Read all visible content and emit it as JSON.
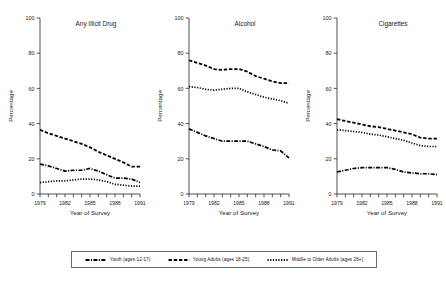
{
  "figure": {
    "ylabel": "Percentage",
    "xlabel": "Year of Survey",
    "ytick_labels": [
      "0",
      "20",
      "40",
      "60",
      "80",
      "100"
    ],
    "xtick_labels": [
      "1979",
      "1982",
      "1985",
      "1988",
      "1991"
    ],
    "line_color": "#000000",
    "axis_color": "#3d3d3d"
  },
  "legend": {
    "items": [
      {
        "label": "Youth (ages 12-17)",
        "dash": "dashdot"
      },
      {
        "label": "Young Adults (ages 18-25)",
        "dash": "dash"
      },
      {
        "label": "Middle to Older Adults (ages 26+)",
        "dash": "dot"
      }
    ]
  },
  "chart_data": [
    {
      "type": "line",
      "title": "Any Illicit Drug",
      "xlabel": "Year of Survey",
      "ylabel": "Percentage",
      "ylim": [
        0,
        100
      ],
      "yticks": [
        0,
        20,
        40,
        60,
        80,
        100
      ],
      "x": [
        1979,
        1980,
        1981,
        1982,
        1983,
        1984,
        1985,
        1986,
        1987,
        1988,
        1989,
        1990,
        1991
      ],
      "grid": false,
      "legend_position": "bottom",
      "series": [
        {
          "name": "Youth (ages 12-17)",
          "dash": "dashdot",
          "values": [
            17.0,
            16.0,
            14.5,
            13.0,
            13.5,
            13.5,
            14.5,
            13.0,
            11.0,
            9.0,
            9.0,
            8.5,
            6.5
          ]
        },
        {
          "name": "Young Adults (ages 18-25)",
          "dash": "dash",
          "values": [
            36.5,
            34.5,
            33.0,
            31.5,
            30.0,
            28.5,
            26.5,
            24.0,
            22.0,
            20.0,
            18.0,
            15.5,
            15.5
          ]
        },
        {
          "name": "Middle to Older Adults (ages 26+)",
          "dash": "dot",
          "values": [
            6.5,
            7.0,
            7.5,
            7.5,
            8.0,
            8.5,
            8.5,
            8.0,
            7.0,
            5.5,
            5.0,
            4.5,
            4.5
          ]
        }
      ]
    },
    {
      "type": "line",
      "title": "Alcohol",
      "xlabel": "Year of Survey",
      "ylabel": "Percentage",
      "ylim": [
        0,
        100
      ],
      "yticks": [
        0,
        20,
        40,
        60,
        80,
        100
      ],
      "x": [
        1979,
        1980,
        1981,
        1982,
        1983,
        1984,
        1985,
        1986,
        1987,
        1988,
        1989,
        1990,
        1991
      ],
      "grid": false,
      "legend_position": "bottom",
      "series": [
        {
          "name": "Youth (ages 12-17)",
          "dash": "dashdot",
          "values": [
            37.0,
            35.0,
            33.0,
            31.5,
            30.0,
            30.0,
            30.0,
            30.0,
            28.5,
            27.0,
            25.0,
            24.5,
            20.5
          ]
        },
        {
          "name": "Young Adults (ages 18-25)",
          "dash": "dash",
          "values": [
            76.0,
            74.5,
            73.0,
            71.0,
            70.5,
            71.0,
            71.0,
            69.5,
            67.0,
            65.5,
            64.0,
            63.0,
            63.0
          ]
        },
        {
          "name": "Middle to Older Adults (ages 26+)",
          "dash": "dot",
          "values": [
            61.0,
            60.5,
            59.5,
            59.0,
            59.5,
            60.0,
            60.0,
            58.0,
            56.5,
            55.0,
            54.0,
            53.0,
            51.5
          ]
        }
      ]
    },
    {
      "type": "line",
      "title": "Cigarettes",
      "xlabel": "Year of Survey",
      "ylabel": "Percentage",
      "ylim": [
        0,
        100
      ],
      "yticks": [
        0,
        20,
        40,
        60,
        80,
        100
      ],
      "x": [
        1979,
        1980,
        1981,
        1982,
        1983,
        1984,
        1985,
        1986,
        1987,
        1988,
        1989,
        1990,
        1991
      ],
      "grid": false,
      "legend_position": "bottom",
      "series": [
        {
          "name": "Youth (ages 12-17)",
          "dash": "dashdot",
          "values": [
            12.5,
            13.5,
            14.5,
            15.0,
            15.0,
            15.0,
            15.0,
            14.0,
            12.5,
            12.0,
            11.5,
            11.5,
            11.0
          ]
        },
        {
          "name": "Young Adults (ages 18-25)",
          "dash": "dash",
          "values": [
            42.5,
            41.5,
            40.5,
            39.5,
            38.5,
            38.0,
            37.0,
            36.0,
            35.0,
            34.0,
            32.0,
            31.5,
            31.5
          ]
        },
        {
          "name": "Middle to Older Adults (ages 26+)",
          "dash": "dot",
          "values": [
            36.5,
            36.0,
            35.5,
            35.0,
            34.0,
            33.5,
            32.5,
            31.5,
            30.5,
            29.0,
            27.5,
            27.0,
            27.0
          ]
        }
      ]
    }
  ]
}
